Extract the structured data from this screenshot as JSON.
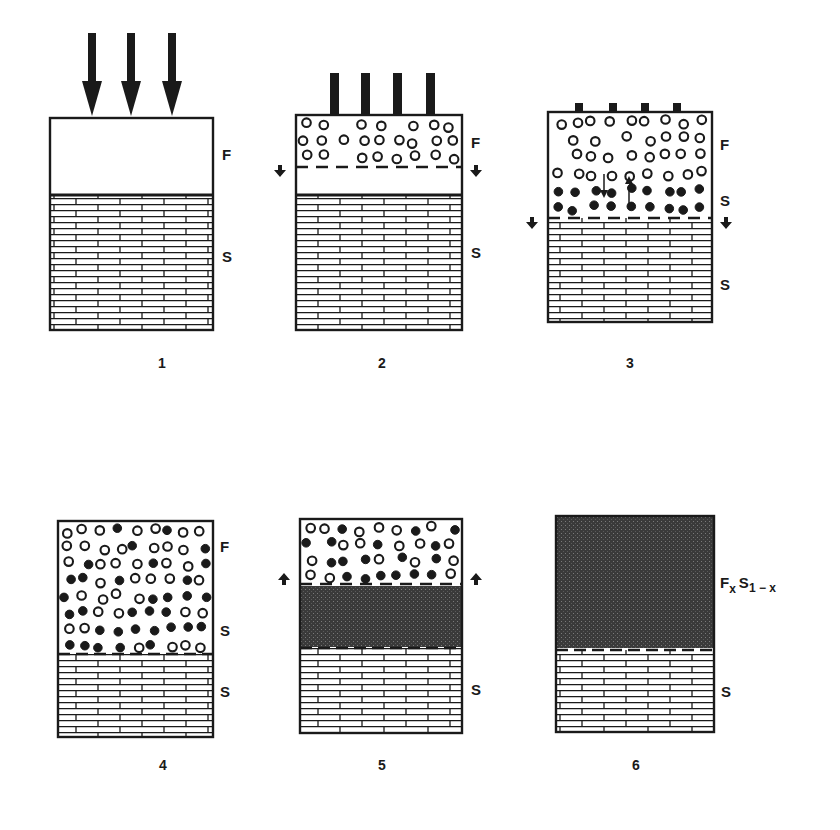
{
  "figure": {
    "colors": {
      "ink": "#1a1a1a",
      "shade": "#3a3a3a",
      "background": "#ffffff"
    },
    "panels": [
      {
        "number": "1",
        "box": [
          50,
          118,
          163,
          212
        ],
        "interface": 195,
        "interface_style": "solid",
        "impact": "arrows",
        "impact_x": [
          92,
          131,
          172
        ],
        "impact_top": 33,
        "labels": [
          {
            "text": "F",
            "x": 222,
            "y": 160
          },
          {
            "text": "S",
            "x": 222,
            "y": 262
          }
        ],
        "caption_xy": [
          162,
          368
        ]
      },
      {
        "number": "2",
        "box": [
          296,
          115,
          166,
          215
        ],
        "interface": 195,
        "interface_style": "solid",
        "dashed": 167,
        "side_arrows": "down",
        "side_arrow_y": 170,
        "impact": "bars",
        "impact_x": [
          334,
          365,
          397,
          430
        ],
        "impact_top": 73,
        "particles": "open",
        "particle_region": [
          115,
          163
        ],
        "labels": [
          {
            "text": "F",
            "x": 471,
            "y": 148
          },
          {
            "text": "S",
            "x": 471,
            "y": 258
          }
        ],
        "caption_xy": [
          382,
          368
        ]
      },
      {
        "number": "3",
        "box": [
          548,
          112,
          164,
          210
        ],
        "dashed": 218,
        "side_arrows": "down",
        "side_arrow_y": 222,
        "impact": "stubs",
        "impact_x": [
          579,
          613,
          645,
          677
        ],
        "impact_top": 103,
        "particles": "open_then_filled",
        "particle_region": [
          112,
          214
        ],
        "labels": [
          {
            "text": "F",
            "x": 720,
            "y": 150
          },
          {
            "text": "S",
            "x": 720,
            "y": 206
          },
          {
            "text": "S",
            "x": 720,
            "y": 290
          }
        ],
        "caption_xy": [
          630,
          368
        ]
      },
      {
        "number": "4",
        "box": [
          58,
          521,
          155,
          216
        ],
        "interface": 654,
        "interface_style": "dashed",
        "particles": "mixed",
        "particle_region": [
          521,
          652
        ],
        "labels": [
          {
            "text": "F",
            "x": 220,
            "y": 552
          },
          {
            "text": "S",
            "x": 220,
            "y": 636
          },
          {
            "text": "S",
            "x": 220,
            "y": 697
          }
        ],
        "caption_xy": [
          163,
          770
        ]
      },
      {
        "number": "5",
        "box": [
          300,
          519,
          162,
          214
        ],
        "dashed": 584,
        "side_arrows": "up",
        "side_arrow_y": 580,
        "shaded": [
          586,
          647
        ],
        "interface": 648,
        "interface_style": "dashed",
        "particles": "mixed",
        "particle_region": [
          519,
          582
        ],
        "labels": [
          {
            "text": "S",
            "x": 471,
            "y": 695
          }
        ],
        "caption_xy": [
          382,
          770
        ]
      },
      {
        "number": "6",
        "box": [
          556,
          516,
          158,
          216
        ],
        "shaded": [
          516,
          648
        ],
        "interface": 650,
        "interface_style": "dashed",
        "labels": [
          {
            "text": "S",
            "x": 721,
            "y": 697
          }
        ],
        "compound_label": {
          "base1": "F",
          "sub1": "x",
          "base2": "S",
          "sub2": "1 − x",
          "x": 720,
          "y": 588
        },
        "caption_xy": [
          636,
          770
        ]
      }
    ]
  }
}
